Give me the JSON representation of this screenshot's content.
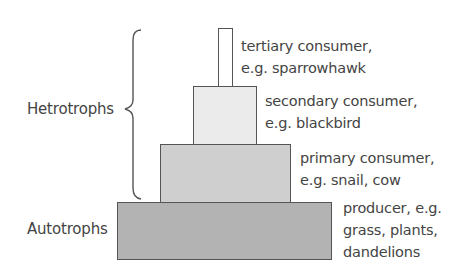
{
  "diagram": {
    "type": "ecological-pyramid",
    "groups": {
      "heterotrophs": "Hetrotrophs",
      "autotrophs": "Autotrophs"
    },
    "tiers": [
      {
        "id": "tertiary",
        "line1": "tertiary consumer,",
        "line2": "e.g. sparrowhawk",
        "fill": "#ffffff"
      },
      {
        "id": "secondary",
        "line1": "secondary consumer,",
        "line2": "e.g. blackbird",
        "fill": "#ebebeb"
      },
      {
        "id": "primary",
        "line1": "primary consumer,",
        "line2": "e.g. snail, cow",
        "fill": "#cfcfcf"
      },
      {
        "id": "producer",
        "line1": "producer, e.g.",
        "line2": "grass, plants,",
        "line3": "dandelions",
        "fill": "#b3b3b3"
      }
    ],
    "colors": {
      "border": "#555555",
      "text": "#444444"
    }
  }
}
